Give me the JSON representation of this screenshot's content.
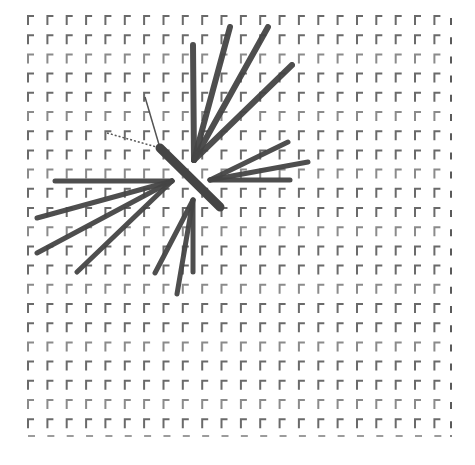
{
  "diagram": {
    "type": "grid-with-radiating-strokes",
    "background": "#ffffff",
    "grid": {
      "origin_x": 28,
      "origin_y": 16,
      "spacing_x": 19.35,
      "spacing_y": 19.2,
      "columns": 22,
      "rows": 22,
      "mark_shape": "corner-gamma",
      "mark_color": "#5a5a5a",
      "mark_height": 9,
      "mark_width": 6,
      "last_column_shape": "vertical-bar",
      "last_row_shape": "horizontal-dash",
      "last_row_y": 436,
      "last_column_x": 451
    },
    "stroke_color": "#454545",
    "fans": [
      {
        "name": "upper-fan",
        "origin": [
          194,
          160
        ],
        "width": 6,
        "endpoints": [
          [
            193,
            45
          ],
          [
            230,
            27
          ],
          [
            268,
            27
          ],
          [
            292,
            65
          ]
        ]
      },
      {
        "name": "right-fan",
        "origin": [
          210,
          180
        ],
        "width": 5,
        "endpoints": [
          [
            288,
            142
          ],
          [
            308,
            162
          ],
          [
            290,
            180
          ]
        ]
      },
      {
        "name": "left-fan",
        "origin": [
          172,
          181
        ],
        "width": 5,
        "endpoints": [
          [
            55,
            181
          ],
          [
            37,
            218
          ],
          [
            37,
            253
          ],
          [
            77,
            272
          ]
        ]
      },
      {
        "name": "lower-fan",
        "origin": [
          193,
          200
        ],
        "width": 5,
        "endpoints": [
          [
            193,
            272
          ],
          [
            177,
            294
          ],
          [
            155,
            273
          ]
        ]
      }
    ],
    "center_bar": {
      "from": [
        160,
        148
      ],
      "to": [
        220,
        207
      ],
      "width": 9
    },
    "thin_lines": [
      {
        "from": [
          145,
          97
        ],
        "to": [
          160,
          148
        ],
        "width": 1.5,
        "dashed": false
      },
      {
        "from": [
          107,
          133
        ],
        "to": [
          160,
          148
        ],
        "width": 1.5,
        "dashed": true
      }
    ]
  }
}
